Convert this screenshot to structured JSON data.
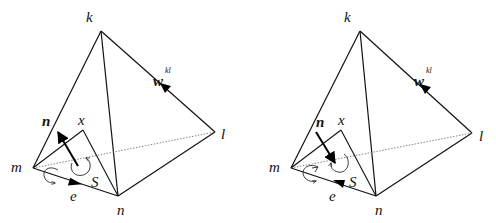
{
  "figure": {
    "panels": [
      {
        "id": "left",
        "labels": {
          "k": "k",
          "l": "l",
          "m": "m",
          "n_vertex": "n",
          "x": "x",
          "normal": "n",
          "edge_vector": "e",
          "surface": "S",
          "w_base": "w",
          "w_sup": "kl"
        },
        "normal_direction": "outward (pointing up-left)",
        "edge_arrow_direction": "m to n"
      },
      {
        "id": "right",
        "labels": {
          "k": "k",
          "l": "l",
          "m": "m",
          "n_vertex": "n",
          "x": "x",
          "normal": "n",
          "edge_vector": "e",
          "surface": "S",
          "w_base": "w",
          "w_sup": "kl"
        },
        "normal_direction": "inward (pointing down-right)",
        "edge_arrow_direction": "n to m"
      }
    ],
    "colors": {
      "line": "#111111",
      "hidden_line": "#777777",
      "background": "#ffffff"
    }
  }
}
